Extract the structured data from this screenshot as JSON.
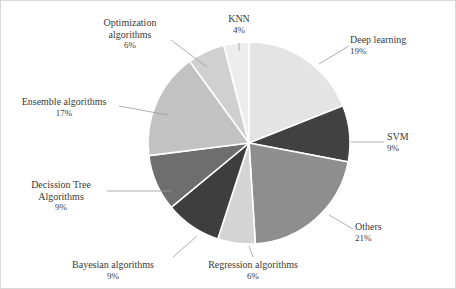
{
  "chart_data": {
    "type": "pie",
    "title": "",
    "subtitle": "",
    "xlabel": "",
    "ylabel": "",
    "legend_position": "none",
    "grid": false,
    "labels_show_percent": true,
    "total_percent": 100,
    "categories": [
      "Deep learning",
      "SVM",
      "Others",
      "Regression algorithms",
      "Bayesian algorithms",
      "Decission Tree Algorithms",
      "Ensemble algorithms",
      "Optimization algorithms",
      "KNN"
    ],
    "values": [
      19,
      9,
      21,
      6,
      9,
      9,
      17,
      6,
      4
    ],
    "value_labels": [
      "19%",
      "9%",
      "21%",
      "6%",
      "9%",
      "9%",
      "17%",
      "6%",
      "4%"
    ],
    "colors": [
      "#e4e4e4",
      "#414141",
      "#8e8e8e",
      "#d4d4d4",
      "#3e3e3e",
      "#6e6e6e",
      "#c2c2c2",
      "#d0d0d0",
      "#ededed"
    ],
    "slice_separator_color": "#ffffff",
    "start_angle_deg": -90,
    "direction": "clockwise",
    "slices": [
      {
        "name": "Deep learning",
        "label_line1": "Deep learning",
        "label_line2": "19%",
        "value": 19,
        "color": "#e4e4e4"
      },
      {
        "name": "SVM",
        "label_line1": "SVM",
        "label_line2": "9%",
        "value": 9,
        "color": "#414141"
      },
      {
        "name": "Others",
        "label_line1": "Others",
        "label_line2": "21%",
        "value": 21,
        "color": "#8e8e8e"
      },
      {
        "name": "Regression algorithms",
        "label_line1": "Regression algorithms",
        "label_line2": "6%",
        "value": 6,
        "color": "#d4d4d4"
      },
      {
        "name": "Bayesian algorithms",
        "label_line1": "Bayesian algorithms",
        "label_line2": "9%",
        "value": 9,
        "color": "#3e3e3e"
      },
      {
        "name": "Decission Tree Algorithms",
        "label_line1": "Decission Tree",
        "label_line2": "Algorithms",
        "label_line3": "9%",
        "value": 9,
        "color": "#6e6e6e"
      },
      {
        "name": "Ensemble algorithms",
        "label_line1": "Ensemble algorithms",
        "label_line2": "17%",
        "value": 17,
        "color": "#c2c2c2"
      },
      {
        "name": "Optimization algorithms",
        "label_line1": "Optimization",
        "label_line2": "algorithms",
        "label_line3": "6%",
        "value": 6,
        "color": "#d0d0d0"
      },
      {
        "name": "KNN",
        "label_line1": "KNN",
        "label_line2": "4%",
        "value": 4,
        "color": "#ededed"
      }
    ]
  }
}
